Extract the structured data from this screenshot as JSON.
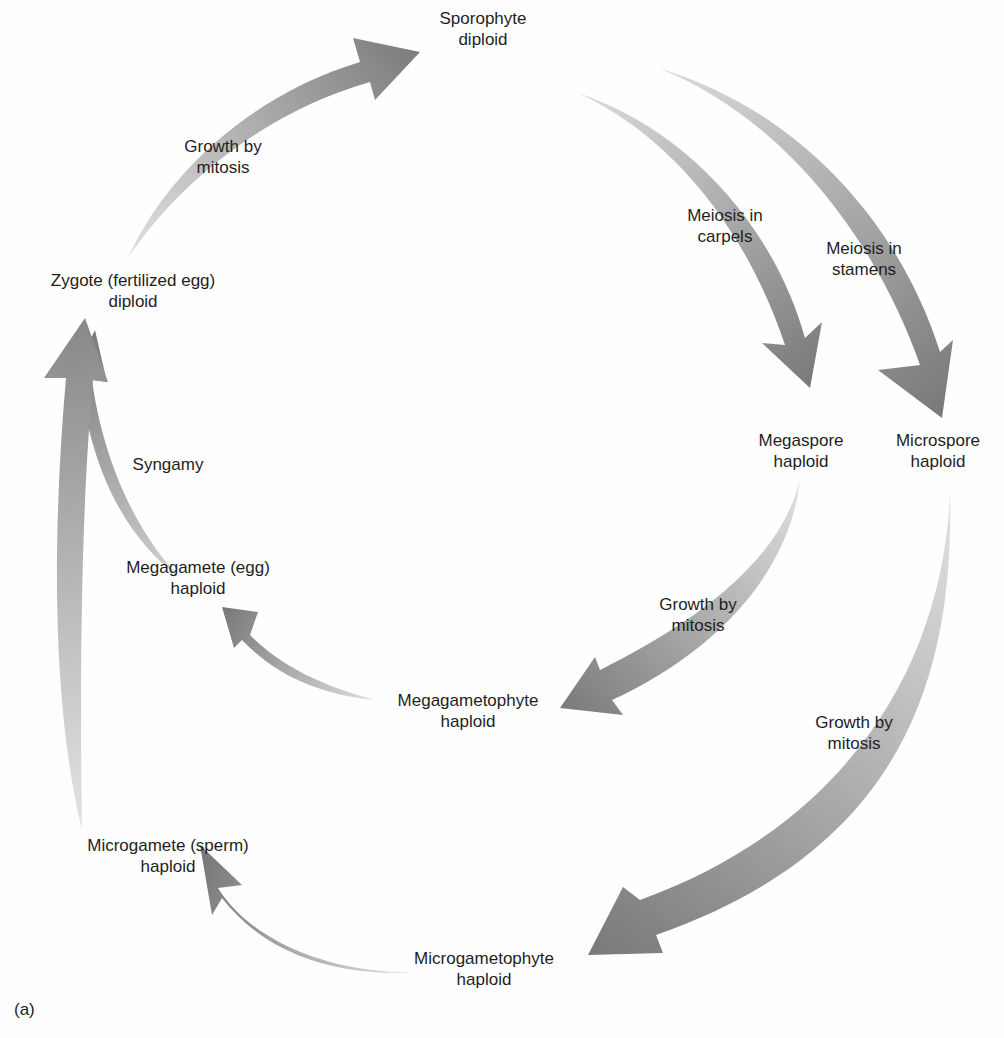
{
  "figure": {
    "panel_label": "(a)",
    "colors": {
      "arrow_dark": "#7a7a7a",
      "arrow_light": "#d6d6d6",
      "text": "#1e1e1e",
      "background": "#fefefe"
    },
    "nodes": [
      {
        "id": "sporophyte",
        "line1": "Sporophyte",
        "line2": "diploid"
      },
      {
        "id": "megaspore",
        "line1": "Megaspore",
        "line2": "haploid"
      },
      {
        "id": "microspore",
        "line1": "Microspore",
        "line2": "haploid"
      },
      {
        "id": "megagametophyte",
        "line1": "Megagametophyte",
        "line2": "haploid"
      },
      {
        "id": "microgametophyte",
        "line1": "Microgametophyte",
        "line2": "haploid"
      },
      {
        "id": "megagamete",
        "line1": "Megagamete (egg)",
        "line2": "haploid"
      },
      {
        "id": "microgamete",
        "line1": "Microgamete (sperm)",
        "line2": "haploid"
      },
      {
        "id": "zygote",
        "line1": "Zygote (fertilized egg)",
        "line2": "diploid"
      }
    ],
    "edges": [
      {
        "from": "zygote",
        "to": "sporophyte",
        "line1": "Growth by",
        "line2": "mitosis"
      },
      {
        "from": "sporophyte",
        "to": "megaspore",
        "line1": "Meiosis in",
        "line2": "carpels"
      },
      {
        "from": "sporophyte",
        "to": "microspore",
        "line1": "Meiosis in",
        "line2": "stamens"
      },
      {
        "from": "megaspore",
        "to": "megagametophyte",
        "line1": "Growth by",
        "line2": "mitosis"
      },
      {
        "from": "microspore",
        "to": "microgametophyte",
        "line1": "Growth by",
        "line2": "mitosis"
      },
      {
        "from": "megagametophyte",
        "to": "megagamete",
        "line1": "",
        "line2": ""
      },
      {
        "from": "microgametophyte",
        "to": "microgamete",
        "line1": "",
        "line2": ""
      },
      {
        "from": "megagamete",
        "to": "zygote",
        "line1": "Syngamy",
        "line2": ""
      },
      {
        "from": "microgamete",
        "to": "zygote",
        "line1": "",
        "line2": ""
      }
    ]
  }
}
